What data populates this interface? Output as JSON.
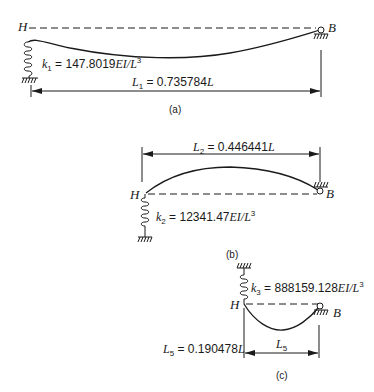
{
  "figure": {
    "panels": [
      {
        "id": "a",
        "caption": "(a)",
        "left_node": "H",
        "right_node": "B",
        "spring_label_k": "k",
        "spring_label_sub": "1",
        "spring_label_eq": " = 147.8019",
        "spring_label_unit": "EI/L",
        "spring_label_exp": "3",
        "length_label_L": "L",
        "length_label_sub": "1",
        "length_label_eq": " = 0.735784",
        "length_label_unit": "L",
        "shape": "sag"
      },
      {
        "id": "b",
        "caption": "(b)",
        "left_node": "H",
        "right_node": "B",
        "spring_label_k": "k",
        "spring_label_sub": "2",
        "spring_label_eq": " = 12341.47",
        "spring_label_unit": "EI/L",
        "spring_label_exp": "3",
        "length_label_L": "L",
        "length_label_sub": "2",
        "length_label_eq": " = 0.446441",
        "length_label_unit": "L",
        "shape": "arch"
      },
      {
        "id": "c",
        "caption": "(c)",
        "left_node": "H",
        "right_node": "B",
        "spring_label_k": "k",
        "spring_label_sub": "3",
        "spring_label_eq": " = 888159.128",
        "spring_label_unit": "EI/L",
        "spring_label_exp": "3",
        "length_label_L": "L",
        "length_label_sub": "5",
        "length_label_eq": " = 0.190478",
        "length_label_unit": "L",
        "dim_label_L": "L",
        "dim_label_sub": "5",
        "shape": "sag"
      }
    ]
  },
  "colors": {
    "ink": "#1a1a1a",
    "background": "#ffffff"
  }
}
